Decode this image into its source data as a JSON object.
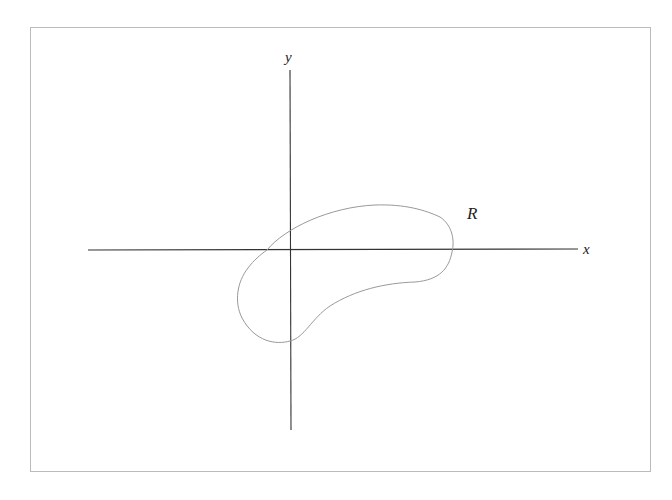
{
  "diagram": {
    "type": "region-in-plane",
    "frame": {
      "x": 30,
      "y": 27,
      "width": 620,
      "height": 444,
      "stroke": "#bbbbbb"
    },
    "axes": {
      "color": "#333333",
      "x_axis": {
        "label": "x",
        "x1": 88,
        "x2": 578,
        "y": 250
      },
      "y_axis": {
        "label": "y",
        "x": 290,
        "y1": 70,
        "y2": 430
      }
    },
    "region": {
      "label": "R",
      "stroke": "#999999",
      "label_position": {
        "x": 474,
        "y": 219
      }
    }
  }
}
